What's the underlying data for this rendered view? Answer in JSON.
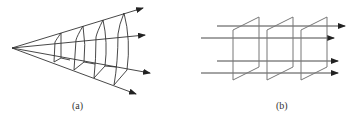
{
  "figure": {
    "panels": [
      {
        "id": "a",
        "label": "(a)",
        "description": "spherical wave fronts diverging from a point source",
        "apex": [
          12,
          48
        ],
        "rays": [
          {
            "end": [
              143,
              8
            ]
          },
          {
            "end": [
              145,
              35
            ]
          },
          {
            "end": [
              150,
              73
            ]
          },
          {
            "end": [
              136,
              94
            ]
          }
        ],
        "wavefronts": 4
      },
      {
        "id": "b",
        "label": "(b)",
        "description": "plane wave fronts with parallel rays",
        "rays_y": [
          26,
          38,
          61,
          73
        ],
        "plates": 3
      }
    ],
    "colors": {
      "stroke": "#333333",
      "background": "#ffffff"
    }
  }
}
